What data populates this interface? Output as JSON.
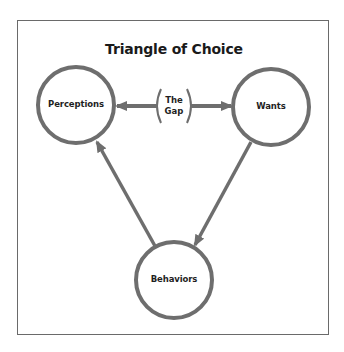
{
  "diagram": {
    "title": "Triangle of Choice",
    "colors": {
      "stroke": "#6e6e6e",
      "frame": "#6a6a6a",
      "text": "#1f1f1f",
      "background": "#ffffff"
    },
    "nodes": [
      {
        "id": "perceptions",
        "label": "Perceptions",
        "cx": 76,
        "cy": 105,
        "r": 38
      },
      {
        "id": "wants",
        "label": "Wants",
        "cx": 271,
        "cy": 107,
        "r": 38
      },
      {
        "id": "behaviors",
        "label": "Behaviors",
        "cx": 174,
        "cy": 280,
        "r": 38
      }
    ],
    "gap": {
      "line1": "The",
      "line2": "Gap"
    },
    "edges": [
      {
        "from": "gap",
        "to": "perceptions",
        "direction": "left"
      },
      {
        "from": "gap",
        "to": "wants",
        "direction": "right"
      },
      {
        "from": "wants",
        "to": "behaviors",
        "direction": "down-left"
      },
      {
        "from": "behaviors",
        "to": "perceptions",
        "direction": "up-left"
      }
    ]
  }
}
